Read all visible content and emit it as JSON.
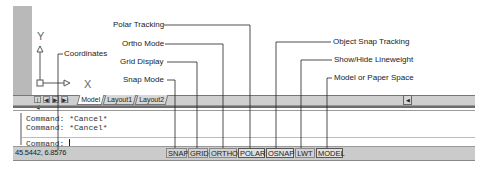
{
  "annotations": {
    "coordinates": "Coordinates",
    "snap_mode": "Snap Mode",
    "grid_display": "Grid Display",
    "ortho_mode": "Ortho Mode",
    "polar_tracking": "Polar Tracking",
    "object_snap_tracking": "Object Snap Tracking",
    "show_hide_lineweight": "Show/Hide Lineweight",
    "model_or_paper_space": "Model or Paper Space"
  },
  "ucs_icon": {
    "x_label": "X",
    "y_label": "Y"
  },
  "tabs": {
    "nav": [
      "|◀",
      "◀",
      "▶",
      "▶|"
    ],
    "items": [
      {
        "label": "Model",
        "active": true
      },
      {
        "label": "Layout1",
        "active": false
      },
      {
        "label": "Layout2",
        "active": false
      }
    ]
  },
  "scroll": {
    "arrow": "◀"
  },
  "command_window": {
    "lines": [
      "Command:  *Cancel*",
      "Command:  *Cancel*"
    ],
    "prompt": "Command:"
  },
  "status_bar": {
    "coordinates": "45.5442, 6.8576",
    "buttons": [
      {
        "label": "SNAP",
        "on": false
      },
      {
        "label": "GRID",
        "on": false
      },
      {
        "label": "ORTHO",
        "on": false
      },
      {
        "label": "POLAR",
        "on": true
      },
      {
        "label": "OSNAP",
        "on": true
      },
      {
        "label": "LWT",
        "on": false
      },
      {
        "label": "MODEL",
        "on": true
      }
    ]
  }
}
